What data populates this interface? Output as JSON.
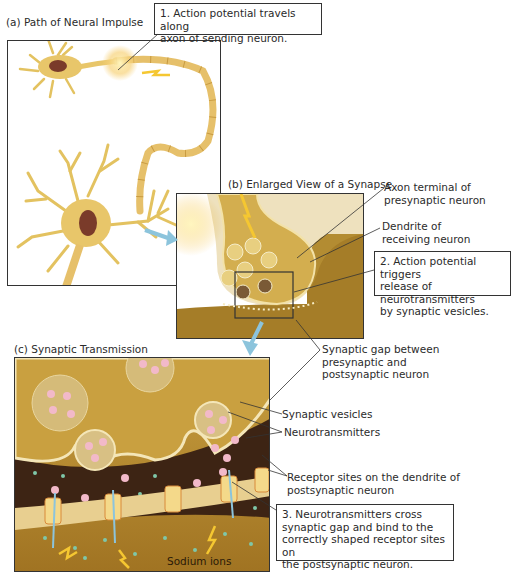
{
  "figure": {
    "panels": [
      {
        "id": "a",
        "title": "(a) Path of Neural Impulse"
      },
      {
        "id": "b",
        "title": "(b) Enlarged View of a Synapse"
      },
      {
        "id": "c",
        "title": "(c) Synaptic Transmission"
      }
    ],
    "callouts": [
      {
        "step": "1",
        "text": "1. Action potential travels along\naxon of sending neuron."
      },
      {
        "step": "2",
        "text": "2. Action potential triggers\nrelease of neurotransmitters\nby synaptic vesicles."
      },
      {
        "step": "3",
        "text": "3. Neurotransmitters cross\nsynaptic gap and bind to the\ncorrectly shaped receptor sites on\nthe postsynaptic neuron."
      }
    ],
    "labels": {
      "axon_terminal": "Axon terminal of\npresynaptic neuron",
      "dendrite": "Dendrite of\nreceiving neuron",
      "synaptic_gap": "Synaptic gap between\npresynaptic and\npostsynaptic neuron",
      "synaptic_vesicles": "Synaptic vesicles",
      "neurotransmitters": "Neurotransmitters",
      "receptor_sites": "Receptor sites on the dendrite of\npostsynaptic neuron",
      "sodium_ions": "Sodium ions"
    },
    "colors": {
      "neuron": "#e8c66a",
      "neuron_dark": "#c9a23e",
      "nucleus": "#7a3b2a",
      "cytoplasm": "#c9a040",
      "gap": "#3d2414",
      "membrane": "#f4e6b8",
      "neurotransmitter": "#f2b9c9",
      "ion": "#7fc7a8",
      "arrow_blue": "#8cc4dc",
      "impulse": "#f5c731"
    }
  }
}
